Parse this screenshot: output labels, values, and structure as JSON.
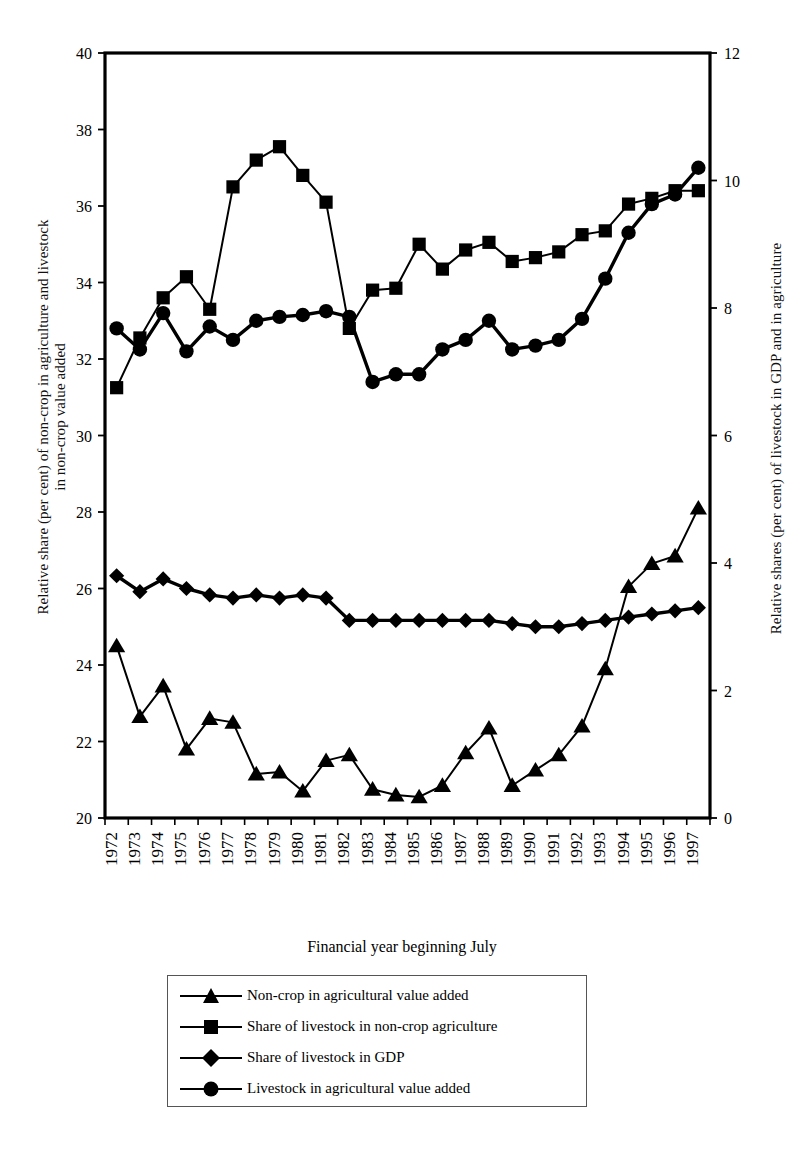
{
  "chart_data": {
    "type": "line",
    "title": "",
    "xlabel": "Financial year beginning July",
    "ylabel_left": "Relative share (per cent) of non-crop in agriculture and livestock in non-crop value added",
    "ylabel_left_line1": "Relative share (per cent) of non-crop in agriculture and livestock",
    "ylabel_left_line2": "in non-crop value added",
    "ylabel_right": "Relative shares (per cent) of livestock in GDP and in agriculture",
    "categories": [
      "1972",
      "1973",
      "1974",
      "1975",
      "1976",
      "1977",
      "1978",
      "1979",
      "1980",
      "1981",
      "1982",
      "1983",
      "1984",
      "1985",
      "1986",
      "1987",
      "1988",
      "1989",
      "1990",
      "1991",
      "1992",
      "1993",
      "1994",
      "1995",
      "1996",
      "1997"
    ],
    "ylim_left": [
      20,
      40
    ],
    "ylim_right": [
      0,
      12
    ],
    "yticks_left": [
      20,
      22,
      24,
      26,
      28,
      30,
      32,
      34,
      36,
      38,
      40
    ],
    "yticks_right": [
      0,
      2,
      4,
      6,
      8,
      10,
      12
    ],
    "grid": false,
    "legend_position": "below-plot",
    "series": [
      {
        "name": "Non-crop in agricultural value added",
        "marker": "triangle",
        "axis": "left",
        "values": [
          24.5,
          22.65,
          23.45,
          21.8,
          22.6,
          22.5,
          21.15,
          21.2,
          20.7,
          21.5,
          21.65,
          20.75,
          20.6,
          20.55,
          20.85,
          21.7,
          22.35,
          20.85,
          21.25,
          21.65,
          22.4,
          23.9,
          26.05,
          26.65,
          26.85,
          28.1
        ]
      },
      {
        "name": "Share of livestock in non-crop agriculture",
        "marker": "square",
        "axis": "left",
        "values": [
          31.25,
          32.55,
          33.6,
          34.15,
          33.3,
          36.5,
          37.2,
          37.55,
          36.8,
          36.1,
          32.8,
          33.8,
          33.85,
          35.0,
          34.35,
          34.85,
          35.05,
          34.55,
          34.65,
          34.8,
          35.25,
          35.35,
          36.05,
          36.2,
          36.4,
          36.4
        ]
      },
      {
        "name": "Share of livestock in GDP",
        "marker": "diamond",
        "axis": "right",
        "values": [
          3.8,
          3.55,
          3.75,
          3.6,
          3.5,
          3.45,
          3.5,
          3.45,
          3.5,
          3.45,
          3.1,
          3.1,
          3.1,
          3.1,
          3.1,
          3.1,
          3.1,
          3.05,
          3.0,
          3.0,
          3.05,
          3.1,
          3.15,
          3.2,
          3.25,
          3.3
        ]
      },
      {
        "name": "Livestock in agricultural value added",
        "marker": "circle",
        "axis": "left",
        "values": [
          32.8,
          32.25,
          33.2,
          32.2,
          32.85,
          32.5,
          33.0,
          33.1,
          33.15,
          33.25,
          33.1,
          31.4,
          31.6,
          31.6,
          32.25,
          32.5,
          33.0,
          32.25,
          32.35,
          32.5,
          33.05,
          34.1,
          35.3,
          36.05,
          36.3,
          37.0
        ]
      }
    ]
  },
  "legend": {
    "items": [
      {
        "label": "Non-crop in agricultural value added",
        "marker": "triangle"
      },
      {
        "label": "Share of livestock in non-crop agriculture",
        "marker": "square"
      },
      {
        "label": "Share of livestock in GDP",
        "marker": "diamond"
      },
      {
        "label": "Livestock in agricultural value added",
        "marker": "circle"
      }
    ]
  },
  "colors": {
    "series": "#000000",
    "axis": "#000000",
    "background": "#ffffff"
  }
}
